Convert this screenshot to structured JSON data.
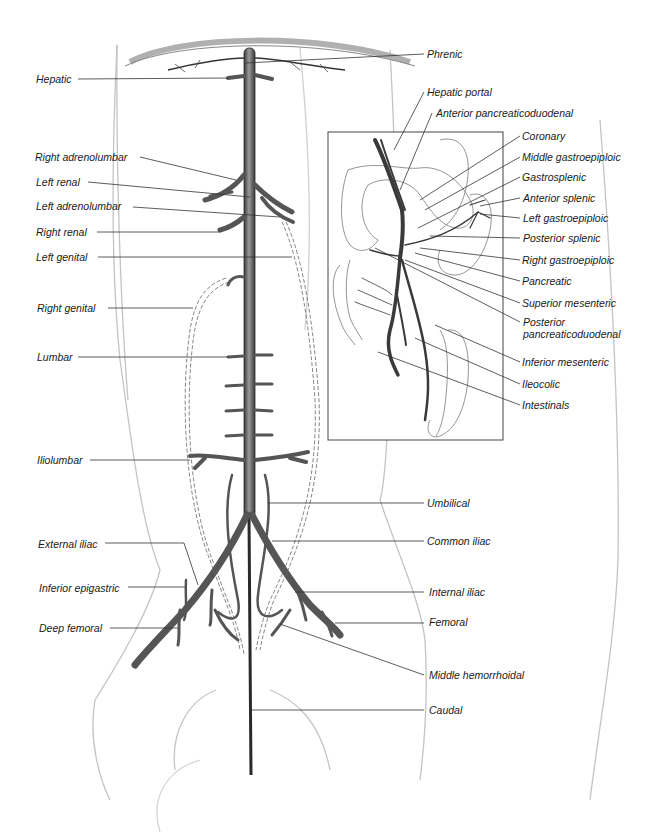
{
  "diagram": {
    "type": "anatomical-illustration",
    "colors": {
      "vessel": "#6e6e6e",
      "vessel_edge": "#2a2a2a",
      "outline": "#bdbdbd",
      "leader": "#333333",
      "text": "#1a1a1a"
    },
    "left_labels": [
      {
        "id": "hepatic",
        "text": "Hepatic"
      },
      {
        "id": "right-adrenolumbar",
        "text": "Right adrenolumbar"
      },
      {
        "id": "left-renal",
        "text": "Left renal"
      },
      {
        "id": "left-adrenolumbar",
        "text": "Left adrenolumbar"
      },
      {
        "id": "right-renal",
        "text": "Right renal"
      },
      {
        "id": "left-genital",
        "text": "Left genital"
      },
      {
        "id": "right-genital",
        "text": "Right genital"
      },
      {
        "id": "lumbar",
        "text": "Lumbar"
      },
      {
        "id": "iliolumbar",
        "text": "Iliolumbar"
      },
      {
        "id": "external-iliac",
        "text": "External iliac"
      },
      {
        "id": "inferior-epigastric",
        "text": "Inferior epigastric"
      },
      {
        "id": "deep-femoral",
        "text": "Deep femoral"
      }
    ],
    "right_labels": [
      {
        "id": "phrenic",
        "text": "Phrenic"
      },
      {
        "id": "umbilical",
        "text": "Umbilical"
      },
      {
        "id": "common-iliac",
        "text": "Common iliac"
      },
      {
        "id": "internal-iliac",
        "text": "Internal iliac"
      },
      {
        "id": "femoral",
        "text": "Femoral"
      },
      {
        "id": "middle-hemorrhoidal",
        "text": "Middle hemorrhoidal"
      },
      {
        "id": "caudal",
        "text": "Caudal"
      }
    ],
    "inset_labels": [
      {
        "id": "hepatic-portal",
        "text": "Hepatic portal"
      },
      {
        "id": "anterior-pancreaticoduodenal",
        "text": "Anterior pancreaticoduodenal"
      },
      {
        "id": "coronary",
        "text": "Coronary"
      },
      {
        "id": "middle-gastroepiploic",
        "text": "Middle gastroepiploic"
      },
      {
        "id": "gastrosplenic",
        "text": "Gastrosplenic"
      },
      {
        "id": "anterior-splenic",
        "text": "Anterior splenic"
      },
      {
        "id": "left-gastroepiploic",
        "text": "Left gastroepiploic"
      },
      {
        "id": "posterior-splenic",
        "text": "Posterior splenic"
      },
      {
        "id": "right-gastroepiploic",
        "text": "Right gastroepiploic"
      },
      {
        "id": "pancreatic",
        "text": "Pancreatic"
      },
      {
        "id": "superior-mesenteric",
        "text": "Superior mesenteric"
      },
      {
        "id": "posterior-pancreaticoduodenal",
        "text": "Posterior pancreaticoduodenal"
      },
      {
        "id": "inferior-mesenteric",
        "text": "Inferior mesenteric"
      },
      {
        "id": "ileocolic",
        "text": "Ileocolic"
      },
      {
        "id": "intestinals",
        "text": "Intestinals"
      }
    ]
  }
}
